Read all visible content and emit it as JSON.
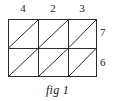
{
  "figure": {
    "caption": "fig 1",
    "top_labels": [
      {
        "value": "4",
        "x": 23
      },
      {
        "value": "2",
        "x": 53
      },
      {
        "value": "3",
        "x": 82
      }
    ],
    "right_labels": [
      {
        "value": "7",
        "y": 27
      },
      {
        "value": "6",
        "y": 57
      }
    ],
    "geometry": {
      "left": 8,
      "right": 97,
      "top": 19,
      "bottom": 77,
      "middle_y": 48,
      "column_x": [
        8,
        38,
        68,
        97
      ],
      "stroke_color": "#2b2b2b",
      "stroke_width": 1,
      "background": "#ffffff"
    },
    "cells": [
      {
        "row": 0,
        "col": 0,
        "diagonal": "bottom-left-to-top-right"
      },
      {
        "row": 0,
        "col": 1,
        "diagonal": "bottom-left-to-top-right"
      },
      {
        "row": 0,
        "col": 2,
        "diagonal": "bottom-left-to-top-right"
      },
      {
        "row": 1,
        "col": 0,
        "diagonal": "bottom-left-to-top-right"
      },
      {
        "row": 1,
        "col": 1,
        "diagonal": "bottom-left-to-top-right"
      },
      {
        "row": 1,
        "col": 2,
        "diagonal": "bottom-left-to-top-right"
      }
    ]
  }
}
